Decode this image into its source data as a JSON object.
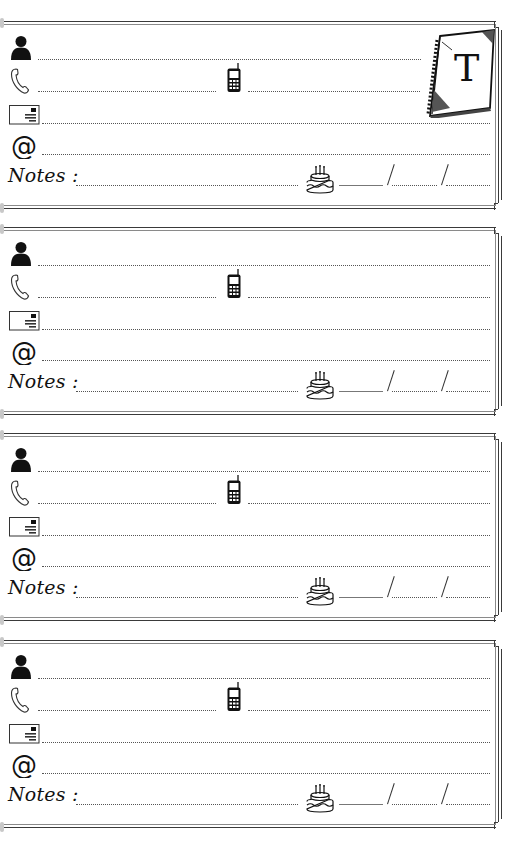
{
  "page": {
    "type": "address-book-page",
    "tab_letter": "T"
  },
  "labels": {
    "notes": "Notes :",
    "date_separator": "/"
  },
  "icons": {
    "name": "person-icon",
    "phone": "telephone-handset-icon",
    "mobile": "mobile-phone-icon",
    "address": "envelope-icon",
    "email": "at-sign-icon",
    "birthday": "birthday-cake-icon",
    "tab": "spiral-notebook-icon"
  },
  "entries": [
    {
      "name": "",
      "phone": "",
      "mobile": "",
      "address": "",
      "email": "",
      "notes": "",
      "birthday": {
        "day": "",
        "month": "",
        "year": ""
      }
    },
    {
      "name": "",
      "phone": "",
      "mobile": "",
      "address": "",
      "email": "",
      "notes": "",
      "birthday": {
        "day": "",
        "month": "",
        "year": ""
      }
    },
    {
      "name": "",
      "phone": "",
      "mobile": "",
      "address": "",
      "email": "",
      "notes": "",
      "birthday": {
        "day": "",
        "month": "",
        "year": ""
      }
    },
    {
      "name": "",
      "phone": "",
      "mobile": "",
      "address": "",
      "email": "",
      "notes": "",
      "birthday": {
        "day": "",
        "month": "",
        "year": ""
      }
    }
  ],
  "colors": {
    "ink": "#111111",
    "border": "#3a3a3a",
    "dots": "#555555",
    "paper": "#ffffff"
  }
}
